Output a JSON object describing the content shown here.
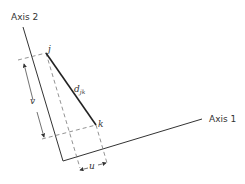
{
  "diagram": {
    "axes": {
      "axis1_label": "Axis 1",
      "axis2_label": "Axis 2"
    },
    "points": {
      "j_label": "j",
      "k_label": "k"
    },
    "distance": {
      "label": "d",
      "subscript": "jk"
    },
    "projections": {
      "u_label": "u",
      "v_label": "v"
    },
    "colors": {
      "line": "#333333",
      "dashed": "#777777"
    }
  }
}
